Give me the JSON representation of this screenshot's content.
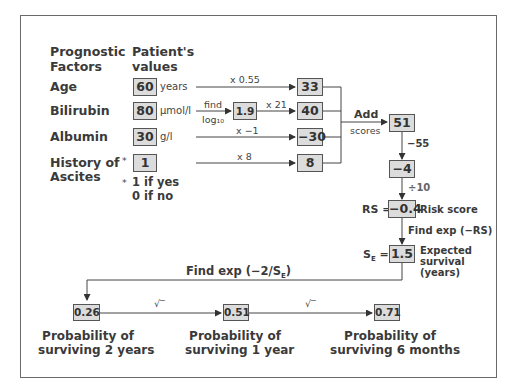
{
  "headers": {
    "factors": [
      "Prognostic",
      "Factors"
    ],
    "values": [
      "Patient's",
      "values"
    ]
  },
  "factors": [
    {
      "label": "Age",
      "value": "60",
      "unit": "years",
      "operation": "x 0.55",
      "score": "33"
    },
    {
      "label": "Bilirubin",
      "value": "80",
      "unit": "µmol/l",
      "pre_op_top": "find",
      "pre_op_bottom": "log₁₀",
      "intermediate": "1.9",
      "operation": "x 21",
      "score": "40"
    },
    {
      "label": "Albumin",
      "value": "30",
      "unit": "g/l",
      "operation": "x −1",
      "score": "−30"
    },
    {
      "label_lines": [
        "History of",
        "Ascites"
      ],
      "marker": "*",
      "value": "1",
      "operation": "x 8",
      "score": "8"
    }
  ],
  "ascites_note": {
    "marker": "*",
    "lines": [
      "1 if yes",
      "0 if no"
    ]
  },
  "aggregation": {
    "add_label": [
      "Add",
      "scores"
    ],
    "total": "51",
    "step1_op": "−55",
    "step1_result": "−4",
    "step2_op": "÷10",
    "rs_prefix": "RS =",
    "rs_value": "−0.4",
    "rs_label": "Risk score",
    "step3_op": "Find exp (−RS)",
    "se_prefix": "S",
    "se_sub": "E",
    "se_eq": " =",
    "se_value": "1.5",
    "se_label": [
      "Expected",
      "survival",
      "(years)"
    ]
  },
  "probabilities": {
    "formula_prefix": "Find exp (−2/S",
    "formula_sub": "E",
    "formula_suffix": ")",
    "sqrt_symbol": "√‾",
    "items": [
      {
        "value": "0.26",
        "caption": [
          "Probability of",
          "surviving 2 years"
        ]
      },
      {
        "value": "0.51",
        "caption": [
          "Probability of",
          "surviving 1 year"
        ]
      },
      {
        "value": "0.71",
        "caption": [
          "Probability of",
          "surviving 6 months"
        ]
      }
    ]
  }
}
